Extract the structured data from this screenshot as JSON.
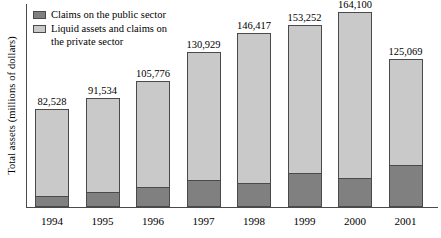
{
  "chart_data": {
    "type": "bar",
    "subtype": "stacked-vertical",
    "title": "",
    "xlabel": "",
    "ylabel": "Total assets (millions of dollars)",
    "categories": [
      "1994",
      "1995",
      "1996",
      "1997",
      "1998",
      "1999",
      "2000",
      "2001"
    ],
    "totals": [
      82528,
      91534,
      105776,
      130929,
      146417,
      153252,
      164100,
      125069
    ],
    "total_labels": [
      "82,528",
      "91,534",
      "105,776",
      "130,929",
      "146,417",
      "153,252",
      "164,100",
      "125,069"
    ],
    "series": [
      {
        "name": "Claims on the public sector",
        "color": "#808080",
        "stack_order": "bottom",
        "values": [
          8300,
          11400,
          15900,
          21600,
          19000,
          28100,
          23800,
          35000
        ]
      },
      {
        "name": "Liquid assets and claims on the private sector",
        "color": "#c9c9c9",
        "stack_order": "top",
        "values": [
          74228,
          80134,
          89876,
          109329,
          127417,
          125152,
          140300,
          90069
        ]
      }
    ],
    "ylim": [
      0,
      171000
    ],
    "grid": false,
    "legend_position": "top-left",
    "value_labels_shown": true
  },
  "legend": {
    "items": [
      {
        "label": "Claims on the public sector",
        "swatch": "public"
      },
      {
        "label": "Liquid assets and claims on the private sector",
        "swatch": "private"
      }
    ],
    "item_0_label": "Claims on the public sector",
    "item_1_line_1": "Liquid assets and claims on",
    "item_1_line_2": "the private sector"
  },
  "axes": {
    "y_title": "Total assets (millions of dollars)"
  },
  "bars": [
    {
      "year": "1994",
      "total_label": "82,528"
    },
    {
      "year": "1995",
      "total_label": "91,534"
    },
    {
      "year": "1996",
      "total_label": "105,776"
    },
    {
      "year": "1997",
      "total_label": "130,929"
    },
    {
      "year": "1998",
      "total_label": "146,417"
    },
    {
      "year": "1999",
      "total_label": "153,252"
    },
    {
      "year": "2000",
      "total_label": "164,100"
    },
    {
      "year": "2001",
      "total_label": "125,069"
    }
  ],
  "colors": {
    "public_sector": "#808080",
    "private_sector": "#c9c9c9",
    "outline": "#4a4a4a",
    "background": "#ffffff"
  }
}
